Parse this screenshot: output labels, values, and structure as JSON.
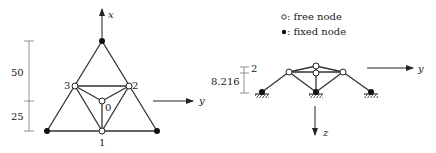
{
  "left_diagram": {
    "view": "top view (x-y plane)",
    "axis_x_label": "x",
    "axis_y_label": "y",
    "dimensions": [
      {
        "label": "50"
      },
      {
        "label": "25"
      }
    ],
    "node_labels": {
      "n0": "0",
      "n1": "1",
      "n2": "2",
      "n3": "3"
    }
  },
  "legend": {
    "free": {
      "symbol": "o",
      "label": ": free node"
    },
    "fixed": {
      "symbol": "•",
      "label": ": fixed node"
    }
  },
  "right_diagram": {
    "view": "side view (y-z plane)",
    "axis_y_label": "y",
    "axis_z_label": "z",
    "dimensions": [
      {
        "label": "8.216"
      },
      {
        "label": "2"
      }
    ]
  },
  "colors": {
    "line": "#333333",
    "fixed_node": "#111111",
    "free_node_fill": "#ffffff"
  }
}
